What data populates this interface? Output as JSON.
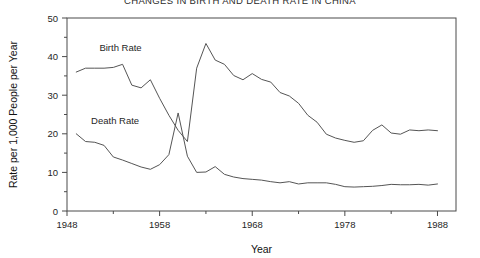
{
  "chart_data": {
    "type": "line",
    "title": "CHANGES IN BIRTH AND DEATH RATE IN CHINA",
    "xlabel": "Year",
    "ylabel": "Rate per 1,000 People per Year",
    "xlim": [
      1948,
      1990
    ],
    "ylim": [
      0,
      50
    ],
    "xticks": [
      1948,
      1958,
      1968,
      1978,
      1988
    ],
    "xtick_labels": [
      "1948",
      "1958",
      "1968",
      "1978",
      "1988"
    ],
    "x_minor_ticks": [
      1953,
      1963,
      1973,
      1983
    ],
    "yticks": [
      0,
      10,
      20,
      30,
      40,
      50
    ],
    "ytick_labels": [
      "0",
      "10",
      "20",
      "30",
      "40",
      "50"
    ],
    "y_minor_ticks": [
      5,
      15,
      25,
      35,
      45
    ],
    "grid": false,
    "legend": "inline-labels",
    "line_color": "#555555",
    "x": [
      1949,
      1950,
      1951,
      1952,
      1953,
      1954,
      1955,
      1956,
      1957,
      1958,
      1959,
      1960,
      1961,
      1962,
      1963,
      1964,
      1965,
      1966,
      1967,
      1968,
      1969,
      1970,
      1971,
      1972,
      1973,
      1974,
      1975,
      1976,
      1977,
      1978,
      1979,
      1980,
      1981,
      1982,
      1983,
      1984,
      1985,
      1986,
      1987,
      1988
    ],
    "series": [
      {
        "name": "Birth Rate",
        "label": "Birth Rate",
        "label_x": 1951.5,
        "label_y": 41.5,
        "values": [
          36.0,
          37.0,
          37.0,
          37.0,
          37.2,
          38.0,
          32.6,
          31.9,
          34.0,
          29.2,
          24.8,
          20.9,
          18.0,
          37.0,
          43.4,
          39.1,
          38.0,
          35.1,
          34.0,
          35.6,
          34.1,
          33.4,
          30.7,
          29.8,
          27.9,
          24.8,
          23.0,
          19.9,
          18.9,
          18.3,
          17.8,
          18.2,
          20.9,
          22.3,
          20.2,
          19.9,
          21.0,
          20.8,
          21.0,
          20.8
        ]
      },
      {
        "name": "Death Rate",
        "label": "Death Rate",
        "label_x": 1950.6,
        "label_y": 22.5,
        "values": [
          20.0,
          18.0,
          17.8,
          17.0,
          14.0,
          13.2,
          12.3,
          11.4,
          10.8,
          12.0,
          14.6,
          25.4,
          14.2,
          10.0,
          10.1,
          11.5,
          9.5,
          8.8,
          8.4,
          8.2,
          8.0,
          7.6,
          7.3,
          7.6,
          7.0,
          7.3,
          7.3,
          7.3,
          6.9,
          6.3,
          6.2,
          6.3,
          6.4,
          6.6,
          6.9,
          6.8,
          6.8,
          6.9,
          6.7,
          7.0
        ]
      }
    ]
  }
}
